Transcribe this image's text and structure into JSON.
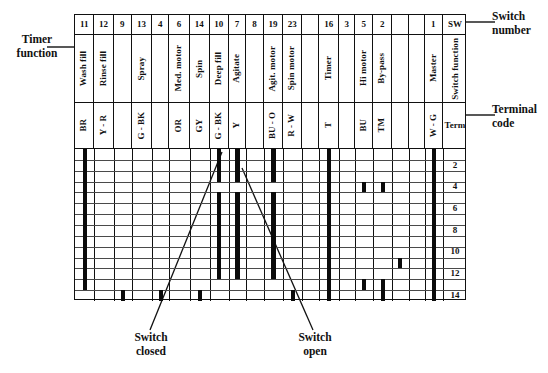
{
  "chart_data": {
    "type": "table",
    "columns": [
      {
        "index": 0,
        "switch_number": "11",
        "timer_function": "Wash fill",
        "terminal_code": "BR"
      },
      {
        "index": 1,
        "switch_number": "12",
        "timer_function": "Rinse fill",
        "terminal_code": "Y - R"
      },
      {
        "index": 2,
        "switch_number": "9",
        "timer_function": "",
        "terminal_code": ""
      },
      {
        "index": 3,
        "switch_number": "13",
        "timer_function": "Spray",
        "terminal_code": "G - BK"
      },
      {
        "index": 4,
        "switch_number": "4",
        "timer_function": "",
        "terminal_code": ""
      },
      {
        "index": 5,
        "switch_number": "6",
        "timer_function": "Med. motor",
        "terminal_code": "OR"
      },
      {
        "index": 6,
        "switch_number": "14",
        "timer_function": "Spin",
        "terminal_code": "GY"
      },
      {
        "index": 7,
        "switch_number": "10",
        "timer_function": "Deep fill",
        "terminal_code": "G - BK"
      },
      {
        "index": 8,
        "switch_number": "7",
        "timer_function": "Agitate",
        "terminal_code": "Y"
      },
      {
        "index": 9,
        "switch_number": "8",
        "timer_function": "",
        "terminal_code": ""
      },
      {
        "index": 10,
        "switch_number": "19",
        "timer_function": "Agit. motor",
        "terminal_code": "BU - O"
      },
      {
        "index": 11,
        "switch_number": "23",
        "timer_function": "Spin motor",
        "terminal_code": "R - W"
      },
      {
        "index": 12,
        "switch_number": "",
        "timer_function": "",
        "terminal_code": ""
      },
      {
        "index": 13,
        "switch_number": "16",
        "timer_function": "Timer",
        "terminal_code": "T"
      },
      {
        "index": 14,
        "switch_number": "3",
        "timer_function": "",
        "terminal_code": ""
      },
      {
        "index": 15,
        "switch_number": "5",
        "timer_function": "Hi motor",
        "terminal_code": "BU"
      },
      {
        "index": 16,
        "switch_number": "2",
        "timer_function": "By-pass",
        "terminal_code": "TM"
      },
      {
        "index": 17,
        "switch_number": "",
        "timer_function": "",
        "terminal_code": ""
      },
      {
        "index": 18,
        "switch_number": "",
        "timer_function": "",
        "terminal_code": ""
      },
      {
        "index": 19,
        "switch_number": "1",
        "timer_function": "Master",
        "terminal_code": "W - G"
      },
      {
        "index": 20,
        "switch_number": "SW",
        "timer_function": "Switch function",
        "terminal_code": "Term"
      }
    ],
    "row_labels": [
      "",
      "2",
      "",
      "4",
      "",
      "6",
      "",
      "8",
      "",
      "10",
      "",
      "12",
      "",
      "14"
    ],
    "row_count": 14,
    "legend": {
      "closed": "Thick black bar = switch closed",
      "open": "Gap / no bar = switch open"
    },
    "closed_segments": [
      {
        "col": 0,
        "start_row": 1,
        "end_row": 13
      },
      {
        "col": 7,
        "start_row": 1,
        "end_row": 3
      },
      {
        "col": 7,
        "start_row": 5,
        "end_row": 12
      },
      {
        "col": 8,
        "start_row": 1,
        "end_row": 3
      },
      {
        "col": 8,
        "start_row": 5,
        "end_row": 12
      },
      {
        "col": 10,
        "start_row": 1,
        "end_row": 3
      },
      {
        "col": 10,
        "start_row": 5,
        "end_row": 12
      },
      {
        "col": 13,
        "start_row": 1,
        "end_row": 14
      },
      {
        "col": 19,
        "start_row": 1,
        "end_row": 14
      },
      {
        "col": 15,
        "start_row": 4,
        "end_row": 4
      },
      {
        "col": 16,
        "start_row": 4,
        "end_row": 4
      },
      {
        "col": 17,
        "start_row": 11,
        "end_row": 11
      },
      {
        "col": 15,
        "start_row": 13,
        "end_row": 13
      },
      {
        "col": 16,
        "start_row": 13,
        "end_row": 14
      },
      {
        "col": 2,
        "start_row": 14,
        "end_row": 14
      },
      {
        "col": 4,
        "start_row": 14,
        "end_row": 14
      },
      {
        "col": 6,
        "start_row": 14,
        "end_row": 14
      },
      {
        "col": 11,
        "start_row": 14,
        "end_row": 14
      }
    ]
  },
  "labels": {
    "timer_function": "Timer\nfunction",
    "switch_number": "Switch\nnumber",
    "terminal_code": "Terminal\ncode",
    "switch_closed": "Switch\nclosed",
    "switch_open": "Switch\nopen"
  }
}
